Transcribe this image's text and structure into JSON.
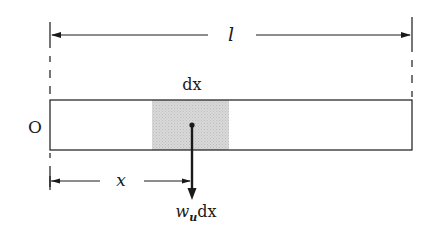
{
  "diagram": {
    "type": "uniform beam with distributed load element",
    "labels": {
      "length": "l",
      "origin": "O",
      "element_width": "dx",
      "position": "x",
      "load_w": "w",
      "load_sub": "u",
      "load_dx": "dx"
    },
    "colors": {
      "line": "#1a1a1a",
      "shade": "#cfcfcf",
      "background": "#ffffff"
    }
  }
}
